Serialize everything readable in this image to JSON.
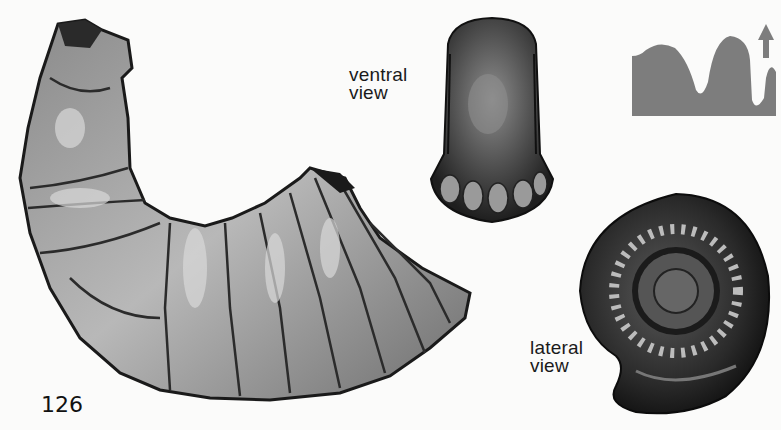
{
  "page": {
    "page_number": "126",
    "background_color": "#fbfbfa"
  },
  "illustrations": {
    "large_fossil": {
      "name": "curved-ammonite-fragment"
    },
    "ventral_view": {
      "label_line1": "ventral",
      "label_line2": "view"
    },
    "lateral_view": {
      "label_line1": "lateral",
      "label_line2": "view"
    }
  },
  "profile_diagram": {
    "icon": "cross-section-profile-icon",
    "arrow": "up-arrow-icon",
    "fill_color": "#7d7d7d"
  }
}
